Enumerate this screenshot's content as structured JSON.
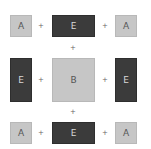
{
  "diagram": {
    "colors": {
      "light_tile": "#c6c6c6",
      "dark_tile": "#3b3b3b",
      "background": "#ffffff"
    },
    "tiles": {
      "top_left": "A",
      "top_center": "E",
      "top_right": "A",
      "middle_left": "E",
      "center": "B",
      "middle_right": "E",
      "bottom_left": "A",
      "bottom_center": "E",
      "bottom_right": "A"
    },
    "operator": "+"
  }
}
